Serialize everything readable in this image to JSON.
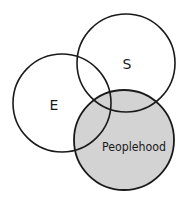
{
  "diagram": {
    "type": "venn",
    "background": "#ffffff",
    "stroke_color": "#1a1a1a",
    "highlight_fill": "#d3d3d3",
    "circles": [
      {
        "id": "E",
        "label": "E",
        "cx": 62,
        "cy": 103,
        "r": 49,
        "filled": false,
        "label_x": 54,
        "label_y": 110
      },
      {
        "id": "S",
        "label": "S",
        "cx": 126,
        "cy": 63,
        "r": 49,
        "filled": false,
        "label_x": 127,
        "label_y": 69
      },
      {
        "id": "Peoplehood",
        "label": "Peoplehood",
        "cx": 124,
        "cy": 140,
        "r": 50,
        "filled": true,
        "label_x": 134,
        "label_y": 151
      }
    ]
  }
}
